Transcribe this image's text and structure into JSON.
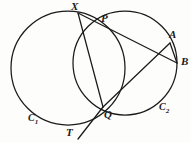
{
  "figure": {
    "background_color": "#fdfdfc",
    "stroke_color": "#1a1a1a",
    "width": 191,
    "height": 143
  },
  "labels": {
    "X": "X",
    "P": "P",
    "A": "A",
    "B": "B",
    "Q": "Q",
    "T": "T",
    "C1_base": "C",
    "C1_sub": "1",
    "C2_base": "C",
    "C2_sub": "2"
  },
  "chart_data": {
    "type": "scatter",
    "xlabel": "",
    "ylabel": "",
    "xlim": [
      0,
      191
    ],
    "ylim": [
      0,
      143
    ],
    "grid": false,
    "legend": "none",
    "circles": [
      {
        "name": "C1",
        "label": "C₁",
        "cx": 68,
        "cy": 68,
        "r": 57,
        "label_x": 28,
        "label_y": 119
      },
      {
        "name": "C2",
        "label": "C₂",
        "cx": 125,
        "cy": 63,
        "r": 52,
        "label_x": 159,
        "label_y": 108
      }
    ],
    "points": [
      {
        "name": "X",
        "x": 78,
        "y": 13,
        "label_x": 71,
        "label_y": 1
      },
      {
        "name": "P",
        "x": 103,
        "y": 28,
        "label_x": 101,
        "label_y": 13
      },
      {
        "name": "A",
        "x": 170,
        "y": 43,
        "label_x": 169,
        "label_y": 29
      },
      {
        "name": "B",
        "x": 177,
        "y": 63,
        "label_x": 181,
        "label_y": 56
      },
      {
        "name": "Q",
        "x": 103,
        "y": 107,
        "label_x": 104,
        "label_y": 109
      },
      {
        "name": "T",
        "x": 78,
        "y": 138,
        "label_x": 66,
        "label_y": 127
      }
    ],
    "segments": [
      {
        "name": "X-to-B",
        "from": "X",
        "to": "B",
        "x1": 78,
        "y1": 13,
        "x2": 177,
        "y2": 63,
        "through": [
          "P"
        ]
      },
      {
        "name": "X-to-Q",
        "from": "X",
        "to": "Q",
        "x1": 78,
        "y1": 13,
        "x2": 103,
        "y2": 107,
        "through": []
      },
      {
        "name": "Q-to-A",
        "from": "Q",
        "to": "A",
        "x1": 103,
        "y1": 107,
        "x2": 170,
        "y2": 43,
        "through": []
      },
      {
        "name": "Q-to-T-tangent",
        "from": "Q",
        "to": "T",
        "x1": 103,
        "y1": 107,
        "x2": 78,
        "y2": 139,
        "through": []
      },
      {
        "name": "A-to-B-chord",
        "from": "A",
        "to": "B",
        "x1": 170,
        "y1": 43,
        "x2": 177,
        "y2": 63,
        "through": []
      }
    ]
  }
}
